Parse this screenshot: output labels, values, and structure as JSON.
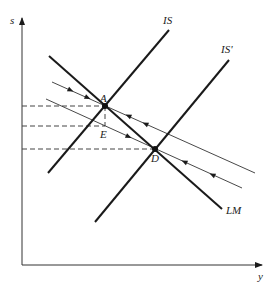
{
  "diagram": {
    "type": "IS-LM phase diagram",
    "axes": {
      "x_label": "y",
      "y_label": "s"
    },
    "curves": {
      "lm_label": "LM",
      "is_label": "IS",
      "is_prime_label": "IS'"
    },
    "points": {
      "a_label": "A",
      "d_label": "D",
      "e_label": "E"
    },
    "colors": {
      "line": "#1a1a1a",
      "dashed": "#444444",
      "background": "#ffffff"
    }
  }
}
